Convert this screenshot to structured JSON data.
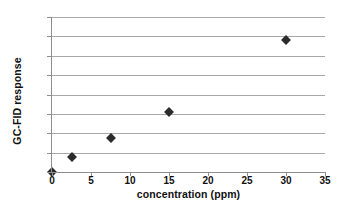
{
  "chart_data": {
    "type": "scatter",
    "title": "",
    "xlabel": "concentration (ppm)",
    "ylabel": "GC-FID response",
    "x": [
      0,
      2.5,
      7.5,
      15,
      30
    ],
    "values": [
      0,
      1500,
      3550,
      6200,
      13600
    ],
    "series": [
      {
        "name": "GC-FID response",
        "points": [
          {
            "x": 0,
            "y": 0
          },
          {
            "x": 2.5,
            "y": 1500
          },
          {
            "x": 7.5,
            "y": 3550
          },
          {
            "x": 15,
            "y": 6200
          },
          {
            "x": 30,
            "y": 13600
          }
        ]
      }
    ],
    "xlim": [
      0,
      35
    ],
    "ylim": [
      0,
      16000
    ],
    "xticks": [
      0,
      5,
      10,
      15,
      20,
      25,
      30,
      35
    ],
    "yticks": [
      0,
      2000,
      4000,
      6000,
      8000,
      10000,
      12000,
      14000,
      16000
    ],
    "xtick_labels": [
      "0",
      "5",
      "10",
      "15",
      "20",
      "25",
      "30",
      "35"
    ],
    "ytick_labels": [
      "0",
      "2000",
      "4000",
      "6000",
      "8000",
      "10000",
      "12000",
      "14000",
      "16000"
    ],
    "grid": "horizontal",
    "legend": "none",
    "marker": "diamond",
    "marker_color": "#2b2b2b",
    "grid_color": "#a8a8a8",
    "axis_color": "#8e8e8e",
    "background_color": "#ffffff"
  }
}
